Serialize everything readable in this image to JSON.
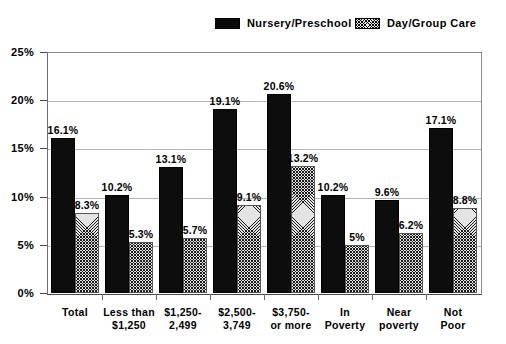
{
  "legend": {
    "items": [
      {
        "label": "Nursery/Preschool",
        "swatch": "solid-black-swatch",
        "color": "#0a0a0a"
      },
      {
        "label": "Day/Group Care",
        "swatch": "hatched-swatch",
        "color": "#e4e4e4"
      }
    ]
  },
  "chart_data": {
    "type": "bar",
    "title": "",
    "subtitle": "",
    "xlabel": "",
    "ylabel": "",
    "ylim": [
      0,
      25
    ],
    "grid": true,
    "legend_position": "top",
    "y_ticks": [
      "0%",
      "5%",
      "10%",
      "15%",
      "20%",
      "25%"
    ],
    "y_tick_values": [
      0,
      5,
      10,
      15,
      20,
      25
    ],
    "categories": [
      "Total",
      "Less than $1,250",
      "$1,250-2,499",
      "$2,500-3,749",
      "$3,750-or more",
      "In Poverty",
      "Near poverty",
      "Not Poor"
    ],
    "category_lines": [
      [
        "Total"
      ],
      [
        "Less than",
        "$1,250"
      ],
      [
        "$1,250-",
        "2,499"
      ],
      [
        "$2,500-",
        "3,749"
      ],
      [
        "$3,750-",
        "or more"
      ],
      [
        "In",
        "Poverty"
      ],
      [
        "Near",
        "poverty"
      ],
      [
        "Not",
        "Poor"
      ]
    ],
    "series": [
      {
        "name": "Nursery/Preschool",
        "values": [
          16.1,
          10.2,
          13.1,
          19.1,
          20.6,
          10.2,
          9.6,
          17.1
        ],
        "labels": [
          "16.1%",
          "10.2%",
          "13.1%",
          "19.1%",
          "20.6%",
          "10.2%",
          "9.6%",
          "17.1%"
        ]
      },
      {
        "name": "Day/Group Care",
        "values": [
          8.3,
          5.3,
          5.7,
          9.1,
          13.2,
          5.0,
          6.2,
          8.8
        ],
        "labels": [
          "8.3%",
          "5.3%",
          "5.7%",
          "9.1%",
          "13.2%",
          "5%",
          "6.2%",
          "8.8%"
        ]
      }
    ]
  }
}
